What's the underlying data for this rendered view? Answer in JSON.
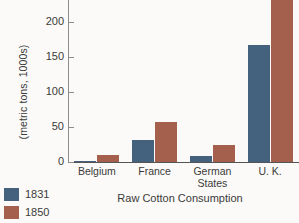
{
  "chart_data": {
    "type": "bar",
    "title": "Raw Cotton Consumption",
    "xlabel": "",
    "ylabel": "(metric tons, 1000s)",
    "categories": [
      "Belgium",
      "France",
      "German States",
      "U. K."
    ],
    "category_lines": [
      [
        "Belgium"
      ],
      [
        "France"
      ],
      [
        "German",
        "States"
      ],
      [
        "U. K."
      ]
    ],
    "series": [
      {
        "name": "1831",
        "color": "#44617d",
        "values": [
          1,
          32,
          8,
          168
        ]
      },
      {
        "name": "1850",
        "color": "#a4604c",
        "values": [
          10,
          58,
          24,
          242
        ]
      }
    ],
    "yticks": [
      0,
      50,
      100,
      150,
      200
    ],
    "ytick_labels": [
      "0",
      "50",
      "100",
      "150",
      "200"
    ],
    "ylim": [
      0,
      232
    ],
    "grid": false,
    "legend_position": "bottom-left"
  },
  "legend": {
    "items": [
      {
        "label": "1831",
        "color": "#44617d"
      },
      {
        "label": "1850",
        "color": "#a4604c"
      }
    ]
  }
}
